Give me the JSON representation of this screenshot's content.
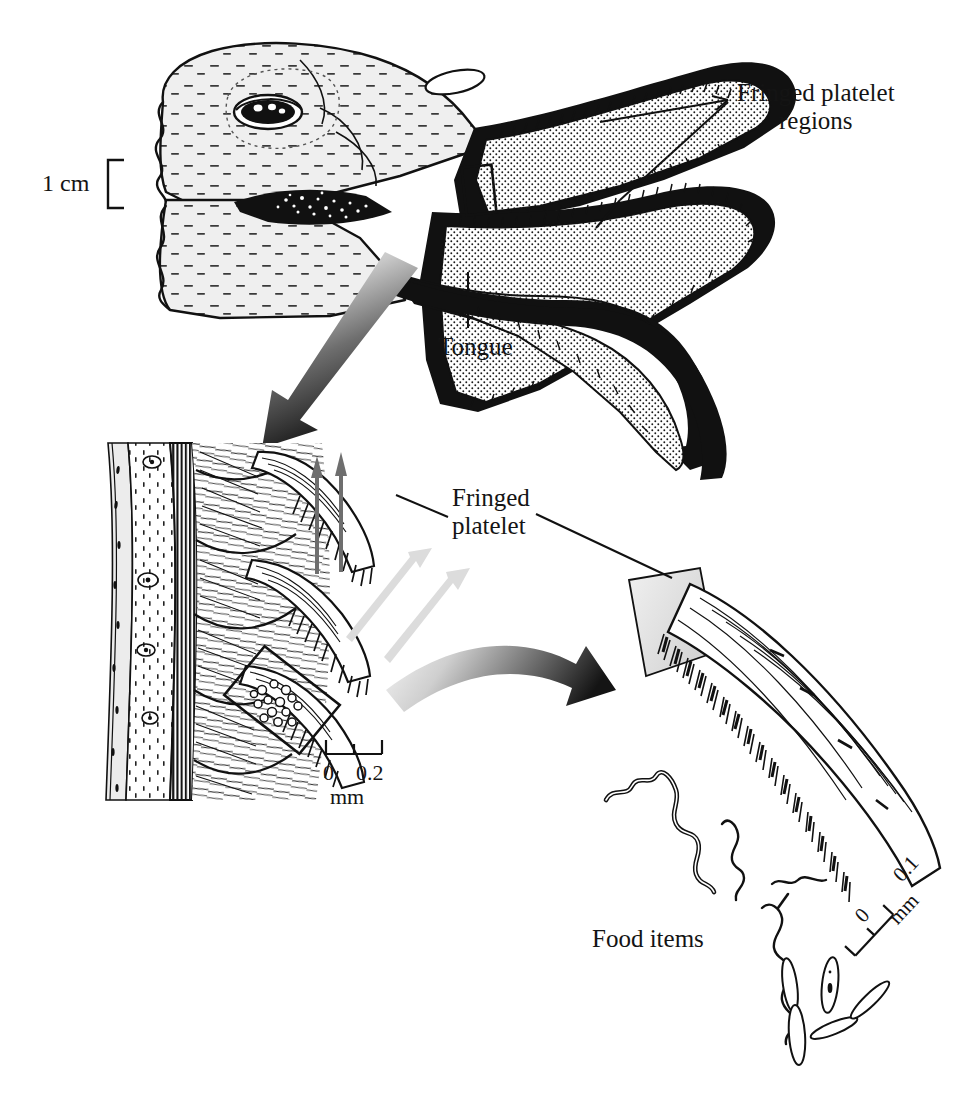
{
  "figure": {
    "kind": "scientific-illustration",
    "background_color": "#ffffff",
    "ink_color": "#111111"
  },
  "labels": {
    "fringed_platelet_regions_line1": "Fringed platelet",
    "fringed_platelet_regions_line2": "regions",
    "fringed_platelet_line1": "Fringed",
    "fringed_platelet_line2": "platelet",
    "tongue": "Tongue",
    "food_items": "Food items"
  },
  "scales": {
    "head": {
      "label": "1 cm",
      "type": "bracket",
      "orientation": "vertical"
    },
    "middle_panel": {
      "min": "0",
      "max": "0.2",
      "units": "mm",
      "ticks": 3,
      "orientation": "horizontal"
    },
    "right_panel": {
      "min": "0",
      "max": "0.1",
      "units": "mm",
      "ticks": 3,
      "orientation": "rotated",
      "rotation_degrees": -47
    }
  },
  "panels": [
    {
      "id": "head-panel",
      "name": "bird-head-bill-cross-section",
      "position": "top",
      "features": [
        "head",
        "eye",
        "nostril",
        "upper-mandible",
        "lower-mandible",
        "tongue",
        "fringed-platelet-regions",
        "inset-marker-rectangle"
      ]
    },
    {
      "id": "middle-panel",
      "name": "bill-lamellae-histology",
      "position": "middle-left",
      "features": [
        "tissue-layers",
        "lamellae",
        "fringed-platelets",
        "trapped-food-particles",
        "inset-marker-rectangle",
        "water-flow-arrows"
      ]
    },
    {
      "id": "right-panel",
      "name": "single-fringed-platelet-detail",
      "position": "bottom-right",
      "features": [
        "platelet-shaft",
        "fringe-hairs",
        "gray-attachment-base",
        "food-items"
      ]
    }
  ],
  "flow_arrows": {
    "water_in_color": "#d9d9d9",
    "water_out_color": "#6e6e6e",
    "water_in_count": 2,
    "water_out_count": 2
  },
  "magnification_arrows": [
    {
      "name": "head-to-middle",
      "direction": "down-left",
      "style": "gradient-light-to-dark"
    },
    {
      "name": "middle-to-right",
      "direction": "right-curved",
      "style": "gradient-light-to-dark"
    }
  ],
  "colors": {
    "ink": "#111111",
    "head_fill": "#efefef",
    "stipple": "#1a1a1a",
    "gray_light": "#dcdcdc",
    "gray_mid": "#9a9a9a",
    "gray_dark": "#5a5a5a"
  }
}
